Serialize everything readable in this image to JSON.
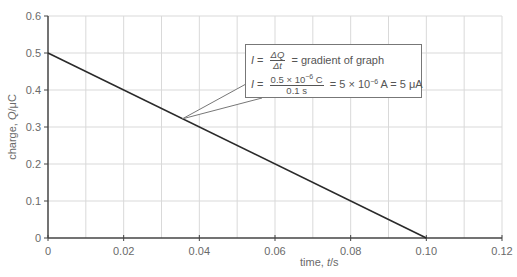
{
  "chart_data": {
    "type": "line",
    "title": "",
    "xlabel_prefix": "time, ",
    "xlabel_var": "t",
    "xlabel_suffix": "/s",
    "ylabel_prefix": "charge, ",
    "ylabel_var": "Q",
    "ylabel_suffix": "/μC",
    "xlim": [
      0,
      0.12
    ],
    "ylim": [
      0,
      0.6
    ],
    "x_ticks": [
      0,
      0.02,
      0.04,
      0.06,
      0.08,
      0.1,
      0.12
    ],
    "x_tick_labels": [
      "0",
      "0.02",
      "0.04",
      "0.06",
      "0.08",
      "0.10",
      "0.12"
    ],
    "y_ticks": [
      0,
      0.1,
      0.2,
      0.3,
      0.4,
      0.5,
      0.6
    ],
    "y_tick_labels": [
      "0",
      "0.1",
      "0.2",
      "0.3",
      "0.4",
      "0.5",
      "0.6"
    ],
    "x_minor_step": 0.01,
    "grid": true,
    "series": [
      {
        "name": "charge",
        "x": [
          0,
          0.1
        ],
        "y": [
          0.5,
          0
        ]
      }
    ],
    "annotation": {
      "points_to": [
        0.0355,
        0.322
      ],
      "line1": {
        "lhs": "I",
        "eq": " = ",
        "num": "ΔQ",
        "den": "Δt",
        "rhs": " = gradient of graph"
      },
      "line2": {
        "lhs": "I",
        "eq": " = ",
        "num_a": "0.5 × 10",
        "num_exp": "−6",
        "num_b": " C",
        "den": "0.1 s",
        "rhs_a": " = 5 × 10",
        "rhs_exp": "−6",
        "rhs_b": " A = 5 μA"
      }
    }
  },
  "colors": {
    "line": "#2a2a2a",
    "axis": "#444444",
    "grid": "#d9d9d9",
    "text": "#6a6a6a"
  }
}
